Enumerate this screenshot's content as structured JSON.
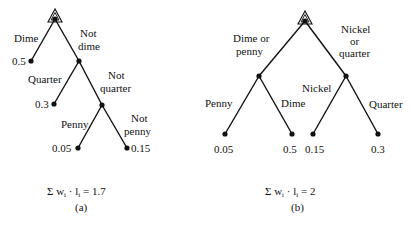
{
  "trees": [
    {
      "id": "a",
      "caption": "(a)",
      "formula_prefix": "Σ w",
      "formula_sub_i": "i",
      "formula_dot": " · l",
      "formula_suffix": " = 1.7",
      "edges": {
        "dime": "Dime",
        "not_dime_1": "Not",
        "not_dime_2": "dime",
        "quarter": "Quarter",
        "not_quarter_1": "Not",
        "not_quarter_2": "quarter",
        "penny": "Penny",
        "not_penny_1": "Not",
        "not_penny_2": "penny"
      },
      "leaves": {
        "dime": "0.5",
        "quarter": "0.3",
        "penny": "0.05",
        "nickel": "0.15"
      }
    },
    {
      "id": "b",
      "caption": "(b)",
      "formula_prefix": "Σ w",
      "formula_sub_i": "i",
      "formula_dot": " · l",
      "formula_suffix": " = 2",
      "edges": {
        "dime_or_penny_1": "Dime or",
        "dime_or_penny_2": "penny",
        "nickel_or_quarter_1": "Nickel",
        "nickel_or_quarter_2": "or",
        "nickel_or_quarter_3": "quarter",
        "penny": "Penny",
        "dime": "Dime",
        "nickel": "Nickel",
        "quarter": "Quarter"
      },
      "leaves": {
        "penny": "0.05",
        "dime": "0.5",
        "nickel": "0.15",
        "quarter": "0.3"
      }
    }
  ]
}
